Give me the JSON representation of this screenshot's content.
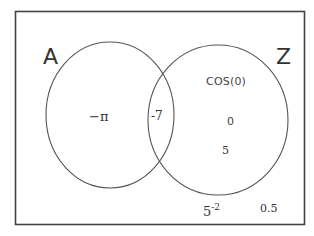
{
  "diagram": {
    "type": "venn",
    "sets": [
      {
        "name": "A",
        "label": "A"
      },
      {
        "name": "Z",
        "label": "Z"
      }
    ],
    "regions": {
      "A_only": [
        "−π"
      ],
      "A_and_Z": [
        "-7"
      ],
      "Z_only": [
        "cos(0)",
        "0",
        "5"
      ],
      "outside": [
        "5^-2",
        "0.5"
      ]
    },
    "colors": {
      "stroke": "#555555",
      "frame": "#444444",
      "background": "#ffffff"
    }
  },
  "labels": {
    "set_a": "A",
    "set_z": "Z",
    "minus_pi": "−π",
    "minus_seven": "-7",
    "cos_zero": "COS(0)",
    "zero": "0",
    "five": "5",
    "five_base": "5",
    "five_exp": "-2",
    "half": "0.5"
  }
}
